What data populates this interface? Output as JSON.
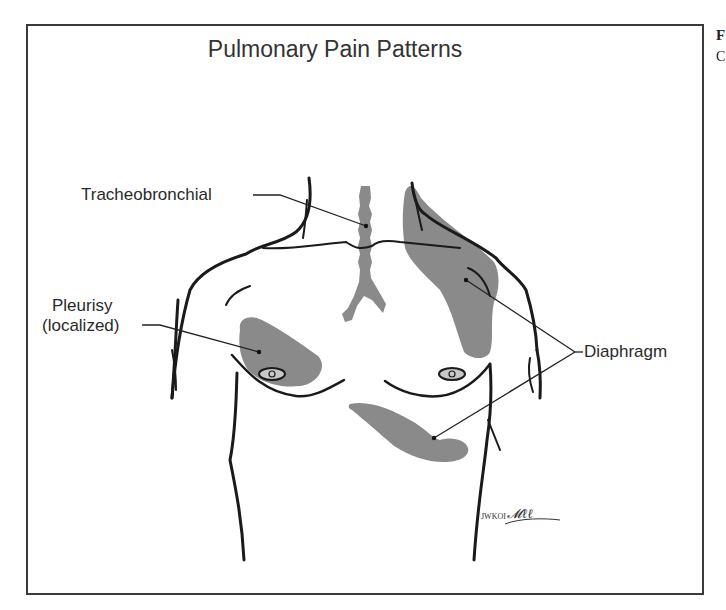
{
  "figure": {
    "title": "Pulmonary Pain Patterns",
    "labels": {
      "tracheobronchial": "Tracheobronchial",
      "pleurisy_line1": "Pleurisy",
      "pleurisy_line2": "(localized)",
      "diaphragm": "Diaphragm"
    },
    "signature": "JWKOI",
    "edge_fragments": {
      "top": "F",
      "second": "C"
    },
    "colors": {
      "shading": "#8a8a8a",
      "outline": "#1a1a1a",
      "nipple_fill": "#c8c8c8"
    }
  }
}
